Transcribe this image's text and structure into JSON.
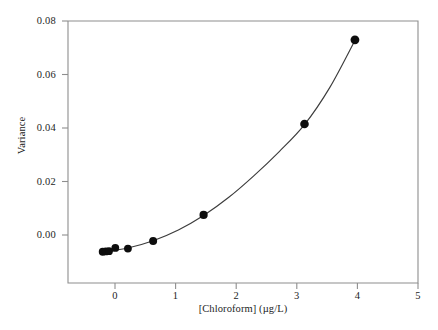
{
  "chart_data": {
    "type": "scatter",
    "title": "",
    "xlabel": "[Chloroform] (µg/L)",
    "ylabel": "Variance",
    "xlim": [
      -0.55,
      5.0
    ],
    "ylim": [
      -0.0105,
      0.08
    ],
    "xticks": [
      0,
      1,
      2,
      3,
      4,
      5
    ],
    "xticklabels": [
      "0",
      "1",
      "2",
      "3",
      "4",
      "5"
    ],
    "yticks": [
      0.0,
      0.02,
      0.04,
      0.06,
      0.08
    ],
    "yticklabels": [
      "0.00",
      "0.02",
      "0.04",
      "0.06",
      "0.08"
    ],
    "grid": false,
    "legend": null,
    "marker": "filled-circle",
    "marker_color": "#0d0d0d",
    "line_color": "#3c3c3c",
    "x": [
      0.0,
      0.05,
      0.1,
      0.2,
      0.4,
      0.8,
      1.6,
      3.2,
      4.0
    ],
    "y": [
      0.0003,
      0.0004,
      0.0005,
      0.0016,
      0.0014,
      0.004,
      0.013,
      0.0444,
      0.0735
    ],
    "series": [
      {
        "name": "Observed variance",
        "x": [
          0.0,
          0.05,
          0.1,
          0.2,
          0.4,
          0.8,
          1.6,
          3.2,
          4.0
        ],
        "values": [
          0.0003,
          0.0004,
          0.0005,
          0.0016,
          0.0014,
          0.004,
          0.013,
          0.0444,
          0.0735
        ]
      },
      {
        "name": "Fitted curve",
        "x": [
          0.0,
          0.4,
          0.8,
          1.2,
          1.6,
          2.0,
          2.4,
          2.8,
          3.2,
          3.6,
          4.0
        ],
        "values": [
          0.0004,
          0.0016,
          0.0041,
          0.0078,
          0.0128,
          0.0191,
          0.0266,
          0.0349,
          0.0442,
          0.057,
          0.0733
        ]
      }
    ]
  },
  "axes": {
    "x_title": "[Chloroform] (µg/L)",
    "y_title": "Variance",
    "x_tick_labels": [
      "0",
      "1",
      "2",
      "3",
      "4",
      "5"
    ],
    "y_tick_labels": [
      "0.00",
      "0.02",
      "0.04",
      "0.06",
      "0.08"
    ]
  },
  "colors": {
    "marker": "#0d0d0d",
    "curve": "#3c3c3c",
    "frame": "#8e8e8e",
    "text": "#1d1d1d",
    "background": "#ffffff"
  }
}
